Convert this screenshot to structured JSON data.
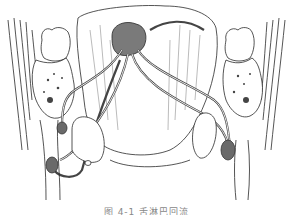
{
  "figure": {
    "colors": {
      "line": "#2a2a2a",
      "vessel": "#555555",
      "node": "#6a6a6a",
      "tumor": "#7a7a7a",
      "background": "#ffffff"
    },
    "elements": [
      "left-tooth",
      "right-tooth",
      "left-mandible",
      "right-mandible",
      "tongue",
      "tumor",
      "lymph-vessels",
      "lymph-nodes",
      "submandibular-glands",
      "jugular-veins"
    ]
  },
  "caption": {
    "text": "图 4-1  舌淋巴回流"
  }
}
